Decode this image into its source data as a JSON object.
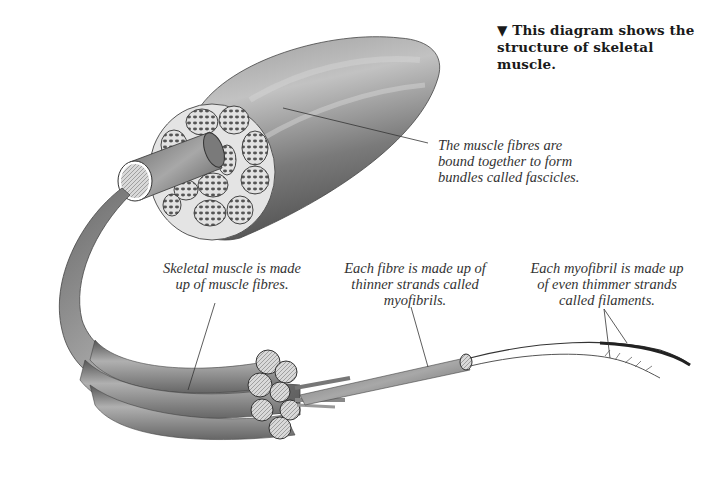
{
  "title": {
    "marker": "▼",
    "line1": "This diagram shows the",
    "line2": "structure of  skeletal muscle."
  },
  "labels": {
    "fascicles": {
      "line1": "The muscle fibres are",
      "line2": "bound together to form",
      "line3": "bundles called fascicles."
    },
    "muscle_fibres": {
      "line1": "Skeletal muscle is made",
      "line2": "up of  muscle fibres."
    },
    "myofibrils": {
      "line1": "Each fibre is made up of",
      "line2": "thinner strands called",
      "line3": "myofibrils."
    },
    "filaments": {
      "line1": "Each myofibril is made up",
      "line2": "of  even thimmer strands",
      "line3": "called filaments."
    }
  },
  "colors": {
    "muscle_dark": "#5a5a5a",
    "muscle_mid": "#8a8a8a",
    "muscle_light": "#c8c8c8",
    "fascicle_fill": "#d6d6d6",
    "leader_line": "#333333"
  }
}
